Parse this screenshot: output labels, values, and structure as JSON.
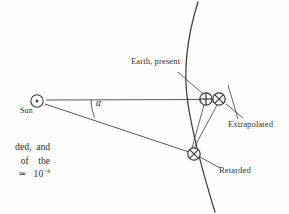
{
  "figure": {
    "name": "sun-earth-retarded-position-diagram",
    "type": "geometric-diagram",
    "background_color": "#fefefe",
    "stroke_color": "#3a3a38",
    "labels": {
      "sun": "Sun",
      "earth_present": "Earth, present",
      "extrapolated": "Extrapolated",
      "retarded": "Retarded",
      "angle": "α"
    },
    "symbols": {
      "sun_glyph": "sun-circle-dot-symbol",
      "earth_present_glyph": "earth-circle-plus-symbol",
      "extrapolated_glyph": "earth-circle-cross-symbol",
      "retarded_glyph": "earth-circle-cross-symbol"
    },
    "geometry": {
      "sun_position": [
        37,
        101
      ],
      "earth_present_position": [
        206,
        99
      ],
      "extrapolated_position": [
        219,
        99
      ],
      "retarded_position": [
        194,
        154
      ],
      "orbit_arc": "curved orbital path running top to bottom through both Earth positions",
      "angle_label_value": "α",
      "angle_arc_radius": 52
    }
  },
  "text_fragment": {
    "line1": "ded,  and",
    "line2": "of    the",
    "line3_prefix": "≃   10",
    "line3_exponent": "−4"
  }
}
